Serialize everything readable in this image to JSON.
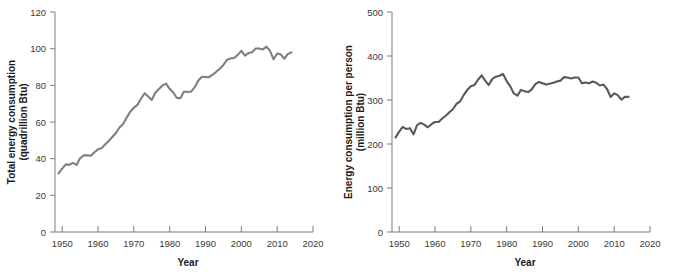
{
  "figure": {
    "background": "#ffffff",
    "line_color_left": "#7f7f7f",
    "line_color_right": "#595959",
    "axis_color": "#7d7d7d"
  },
  "chart_data": [
    {
      "type": "line",
      "panel": "left",
      "title": "",
      "xlabel": "Year",
      "ylabel": "Total energy consumption\n(quadrillion Btu)",
      "ylabel_line1": "Total energy consumption",
      "ylabel_line2": "(quadrillion Btu)",
      "xlim": [
        1948,
        2020
      ],
      "ylim": [
        0,
        120
      ],
      "xticks": [
        1950,
        1960,
        1970,
        1980,
        1990,
        2000,
        2010,
        2020
      ],
      "yticks": [
        0,
        20,
        40,
        60,
        80,
        100,
        120
      ],
      "xtick_labels": [
        "1950",
        "1960",
        "1970",
        "1980",
        "1990",
        "2000",
        "2010",
        "2020"
      ],
      "ytick_labels": [
        "0",
        "20",
        "40",
        "60",
        "80",
        "100",
        "120"
      ],
      "grid": false,
      "legend": "none",
      "series": [
        {
          "name": "Total energy consumption (quadrillion Btu)",
          "x": [
            1949,
            1950,
            1951,
            1952,
            1953,
            1954,
            1955,
            1956,
            1957,
            1958,
            1959,
            1960,
            1961,
            1962,
            1963,
            1964,
            1965,
            1966,
            1967,
            1968,
            1969,
            1970,
            1971,
            1972,
            1973,
            1974,
            1975,
            1976,
            1977,
            1978,
            1979,
            1980,
            1981,
            1982,
            1983,
            1984,
            1985,
            1986,
            1987,
            1988,
            1989,
            1990,
            1991,
            1992,
            1993,
            1994,
            1995,
            1996,
            1997,
            1998,
            1999,
            2000,
            2001,
            2002,
            2003,
            2004,
            2005,
            2006,
            2007,
            2008,
            2009,
            2010,
            2011,
            2012,
            2013,
            2014
          ],
          "values": [
            32.0,
            34.6,
            36.9,
            36.7,
            37.7,
            36.6,
            40.2,
            41.8,
            41.8,
            41.6,
            43.5,
            45.1,
            45.7,
            47.8,
            49.6,
            51.8,
            54.0,
            57.0,
            58.9,
            62.4,
            65.6,
            67.8,
            69.3,
            72.7,
            75.7,
            73.9,
            72.0,
            76.0,
            78.0,
            79.9,
            80.9,
            78.1,
            76.1,
            73.1,
            73.0,
            76.6,
            76.4,
            76.6,
            79.0,
            82.6,
            84.7,
            84.5,
            84.5,
            85.8,
            87.4,
            89.1,
            91.1,
            94.0,
            94.6,
            94.9,
            96.6,
            98.8,
            96.2,
            97.6,
            98.0,
            100.1,
            100.1,
            99.6,
            101.1,
            98.8,
            94.2,
            97.4,
            96.9,
            94.5,
            97.1,
            98.0
          ]
        }
      ]
    },
    {
      "type": "line",
      "panel": "right",
      "title": "",
      "xlabel": "Year",
      "ylabel": "Energy consumption per person\n(million Btu)",
      "ylabel_line1": "Energy consumption per person",
      "ylabel_line2": "(million Btu)",
      "xlim": [
        1948,
        2020
      ],
      "ylim": [
        0,
        500
      ],
      "xticks": [
        1950,
        1960,
        1970,
        1980,
        1990,
        2000,
        2010,
        2020
      ],
      "yticks": [
        0,
        100,
        200,
        300,
        400,
        500
      ],
      "xtick_labels": [
        "1950",
        "1960",
        "1970",
        "1980",
        "1990",
        "2000",
        "2010",
        "2020"
      ],
      "ytick_labels": [
        "0",
        "100",
        "200",
        "300",
        "400",
        "500"
      ],
      "grid": false,
      "legend": "none",
      "series": [
        {
          "name": "Energy consumption per person (million Btu)",
          "x": [
            1949,
            1950,
            1951,
            1952,
            1953,
            1954,
            1955,
            1956,
            1957,
            1958,
            1959,
            1960,
            1961,
            1962,
            1963,
            1964,
            1965,
            1966,
            1967,
            1968,
            1969,
            1970,
            1971,
            1972,
            1973,
            1974,
            1975,
            1976,
            1977,
            1978,
            1979,
            1980,
            1981,
            1982,
            1983,
            1984,
            1985,
            1986,
            1987,
            1988,
            1989,
            1990,
            1991,
            1992,
            1993,
            1994,
            1995,
            1996,
            1997,
            1998,
            1999,
            2000,
            2001,
            2002,
            2003,
            2004,
            2005,
            2006,
            2007,
            2008,
            2009,
            2010,
            2011,
            2012,
            2013,
            2014
          ],
          "values": [
            215,
            228,
            239,
            234,
            236,
            222,
            243,
            248,
            244,
            238,
            245,
            250,
            250,
            258,
            264,
            272,
            279,
            291,
            297,
            311,
            323,
            331,
            334,
            346,
            356,
            344,
            334,
            348,
            353,
            355,
            359,
            343,
            331,
            315,
            310,
            323,
            320,
            318,
            324,
            336,
            341,
            338,
            335,
            337,
            339,
            342,
            344,
            352,
            351,
            349,
            351,
            351,
            338,
            340,
            338,
            342,
            339,
            333,
            335,
            325,
            307,
            315,
            311,
            301,
            307,
            307
          ]
        }
      ]
    }
  ]
}
